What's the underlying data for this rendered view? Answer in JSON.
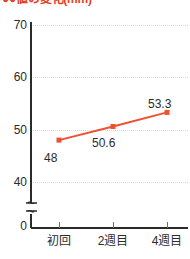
{
  "chart_data": {
    "type": "line",
    "title": "●●値の変化(mm)",
    "title_bullets": "●●",
    "title_rest": "値の変化(mm)",
    "title_color": "#e8401f",
    "categories": [
      "初回",
      "2週目",
      "4週目"
    ],
    "values": [
      48,
      50.6,
      53.3
    ],
    "value_labels": [
      "48",
      "50.6",
      "53.3"
    ],
    "series": [
      {
        "name": "",
        "values": [
          48,
          50.6,
          53.3
        ],
        "color": "#ef5130"
      }
    ],
    "xlabel": "",
    "ylabel": "",
    "ylim": [
      38,
      72
    ],
    "y_ticks": [
      70,
      60,
      50,
      40
    ],
    "y_tick_labels": [
      "70",
      "60",
      "50",
      "40"
    ],
    "y_origin_label": "0",
    "axis_break": true,
    "grid": true,
    "grid_color": "#d9d9d9",
    "legend": "none",
    "axis_color": "#2b2b2b",
    "background": "#ffffff"
  },
  "icons": {
    "axis_break": "axis-break-icon"
  }
}
